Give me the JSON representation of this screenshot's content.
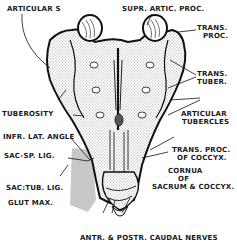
{
  "figure": {
    "colors": {
      "ink": "#1a1a1a",
      "paper": "#ffffff",
      "bone_fill": "#f4f4f4"
    }
  },
  "labels": {
    "articular_s": "ARTICULAR S",
    "supr_artic_proc": "SUPR. ARTIC. PROC.",
    "trans_proc_1": "TRANS.",
    "trans_proc_2": "PROC.",
    "trans_tuber_1": "TRANS.",
    "trans_tuber_2": "TUBER.",
    "tuberosity": "TUBEROSITY",
    "articular_tubercles_1": "ARTICULAR",
    "articular_tubercles_2": "TUBERCLES",
    "infr_lat_angle": "INFR. LAT. ANGLE",
    "trans_proc_coccyx_1": "TRANS. PROC.",
    "trans_proc_coccyx_2": "OF COCCYX.",
    "sac_sp_lig": "SAC-SP. LIG.",
    "cornua_1": "CORNUA",
    "cornua_2": "OF",
    "cornua_3": "SACRUM & COCCYX.",
    "sac_tub_lig": "SAC:TUB. LIG.",
    "glut_max": "GLUT MAX.",
    "caudal_nerves": "ANTR. & POSTR. CAUDAL NERVES"
  }
}
